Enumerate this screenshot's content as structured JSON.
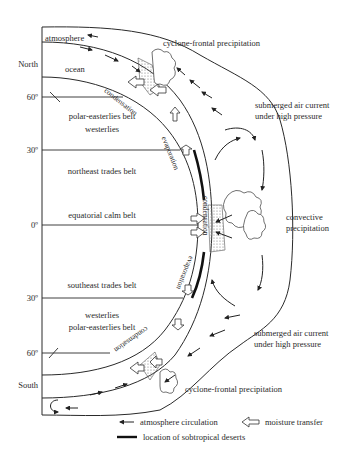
{
  "diagram": {
    "type": "atmospheric-ocean moisture circulation cross-section",
    "hemispheres": {
      "north": "North",
      "south": "South"
    },
    "latitudes": [
      "60º",
      "30º",
      "0º",
      "30º",
      "60º"
    ],
    "layers": {
      "atmosphere": "atmosphere",
      "ocean": "ocean"
    },
    "belts": {
      "north_polar": "polar-easterlies belt",
      "north_westerlies": "westerlies",
      "northeast_trades": "northeast trades belt",
      "equatorial": "equatorial calm belt",
      "southeast_trades": "southeast trades belt",
      "south_westerlies": "westerlies",
      "south_polar": "polar-easterlies belt"
    },
    "processes": {
      "condensation_north": "condensation",
      "evaporation_north": "evaporation",
      "condensation_equator": "condensation",
      "evaporation_south": "evaporation",
      "condensation_south": "condensation"
    },
    "annotations": {
      "cyclone_north": "cyclone-frontal precipitation",
      "submerged_north_1": "submerged air current",
      "submerged_north_2": "under high pressure",
      "convective_1": "convective",
      "convective_2": "precipitation",
      "submerged_south_1": "submerged air current",
      "submerged_south_2": "under high pressure",
      "cyclone_south": "cyclone-frontal precipitation"
    },
    "legend": {
      "atmosphere_circulation": "atmosphere circulation",
      "moisture_transfer": "moisture transfer",
      "deserts": "location of sobtropical deserts"
    },
    "colors": {
      "ink": "#2a2a2a",
      "background": "#ffffff",
      "stipple": "#888888"
    }
  }
}
